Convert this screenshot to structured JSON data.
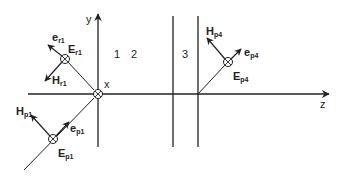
{
  "diagram": {
    "type": "wave-incidence-layered-media",
    "colors": {
      "line": "#222222",
      "background": "#ffffff"
    },
    "axes": {
      "y_label": "y",
      "z_label": "z",
      "x_label": "x"
    },
    "regions": [
      {
        "id": "1",
        "label": "1"
      },
      {
        "id": "2",
        "label": "2"
      },
      {
        "id": "3",
        "label": "3"
      }
    ],
    "incident": {
      "e_label": "e",
      "e_sub": "p1",
      "E_label": "E",
      "E_sub": "p1",
      "H_label": "H",
      "H_sub": "p1"
    },
    "reflected": {
      "e_label": "e",
      "e_sub": "r1",
      "E_label": "E",
      "E_sub": "r1",
      "H_label": "H",
      "H_sub": "r1"
    },
    "transmitted": {
      "e_label": "e",
      "e_sub": "p4",
      "E_label": "E",
      "E_sub": "p4",
      "H_label": "H",
      "H_sub": "p4"
    }
  }
}
